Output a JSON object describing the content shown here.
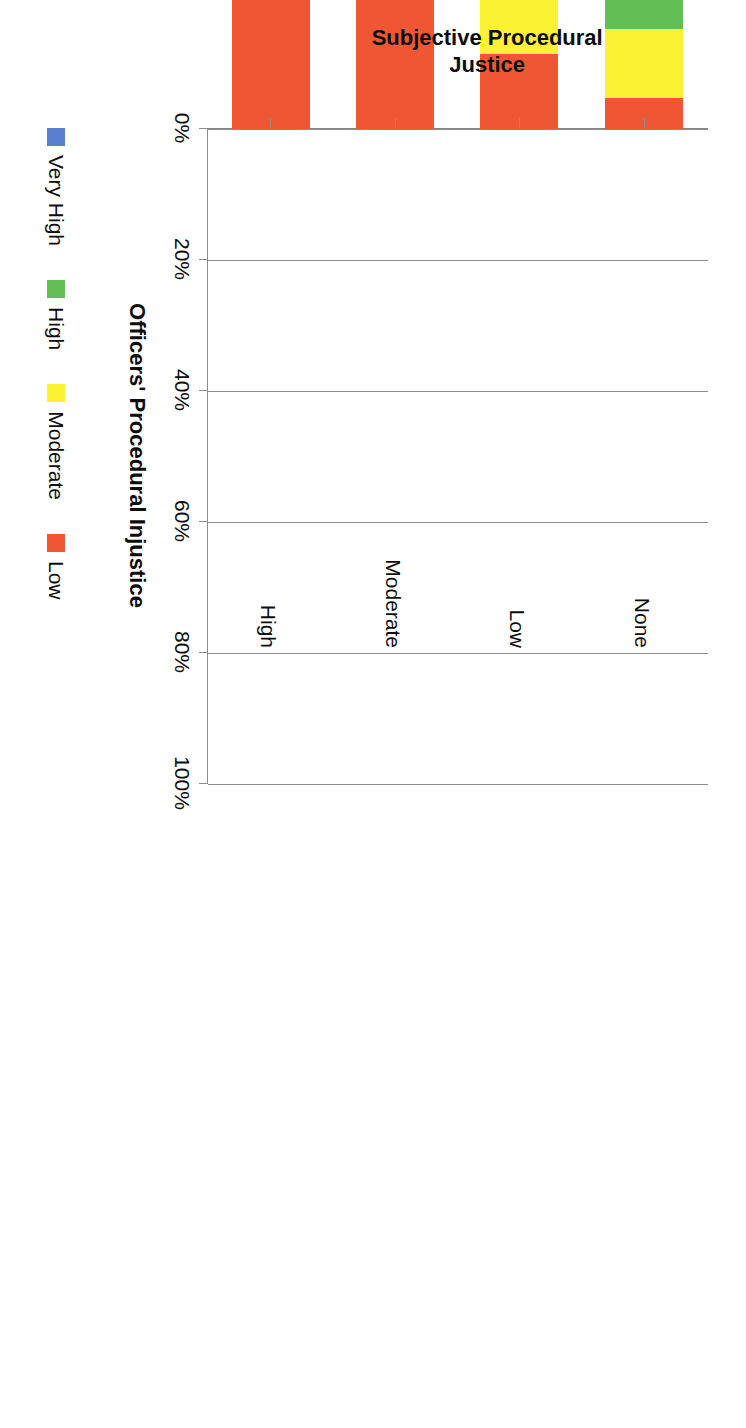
{
  "chart_data": {
    "type": "bar",
    "subtype": "stacked-bar-100-horizontal",
    "title": "",
    "xlabel": "Officers' Procedural Injustice",
    "ylabel": "Subjective Procedural Justice",
    "ylabel_lines": [
      "Subjective Procedural",
      "Justice"
    ],
    "categories": [
      "None",
      "Low",
      "Moderate",
      "High"
    ],
    "series": [
      {
        "name": "Very High",
        "color": "#5b7fd0",
        "values": [
          74.0,
          56.8,
          39.8,
          31.1
        ]
      },
      {
        "name": "High",
        "color": "#63bf55",
        "values": [
          10.7,
          21.2,
          18.5,
          0.0
        ]
      },
      {
        "name": "Moderate",
        "color": "#fbf233",
        "values": [
          10.6,
          10.5,
          18.5,
          30.4
        ]
      },
      {
        "name": "Low",
        "color": "#ef5734",
        "values": [
          4.7,
          11.5,
          23.2,
          38.5
        ]
      }
    ],
    "stack_order_from_axis": [
      "Low",
      "Moderate",
      "High",
      "Very High"
    ],
    "value_ticks": [
      "0%",
      "20%",
      "40%",
      "60%",
      "80%",
      "100%"
    ],
    "value_tick_values": [
      0,
      20,
      40,
      60,
      80,
      100
    ],
    "xlim": [
      0,
      100
    ],
    "grid": "vertical",
    "legend_position": "bottom-left",
    "legend_entries": [
      "Very High",
      "High",
      "Moderate",
      "Low"
    ],
    "units": "percent",
    "axis_color": "#8d8d8d",
    "text_color": "#0d0d0d",
    "background": "#ffffff"
  },
  "legend": {
    "items": [
      {
        "label": "Very High",
        "swatch": "legend-swatch-very-high"
      },
      {
        "label": "High",
        "swatch": "legend-swatch-high"
      },
      {
        "label": "Moderate",
        "swatch": "legend-swatch-moderate"
      },
      {
        "label": "Low",
        "swatch": "legend-swatch-low"
      }
    ]
  },
  "axes": {
    "value_axis_title": "Officers' Procedural Injustice",
    "category_axis_title_line1": "Subjective Procedural",
    "category_axis_title_line2": "Justice",
    "ticks": {
      "t0": "0%",
      "t20": "20%",
      "t40": "40%",
      "t60": "60%",
      "t80": "80%",
      "t100": "100%"
    },
    "category_labels": {
      "c0": "None",
      "c1": "Low",
      "c2": "Moderate",
      "c3": "High"
    }
  }
}
